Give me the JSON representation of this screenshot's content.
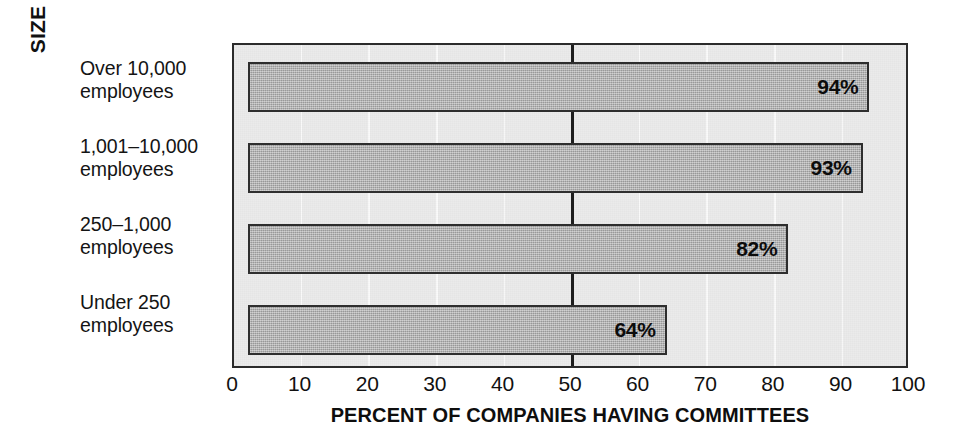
{
  "chart_data": {
    "type": "bar",
    "orientation": "horizontal",
    "title": "",
    "subtitle": "",
    "xlabel": "PERCENT OF COMPANIES HAVING COMMITTEES",
    "ylabel": "SIZE OF COMPANY",
    "categories": [
      "Over 10,000 employees",
      "1,001–10,000 employees",
      "250–1,000 employees",
      "Under 250 employees"
    ],
    "category_lines": [
      [
        "Over 10,000",
        "employees"
      ],
      [
        "1,001–10,000",
        "employees"
      ],
      [
        "250–1,000",
        "employees"
      ],
      [
        "Under 250",
        "employees"
      ]
    ],
    "values": [
      94,
      93,
      82,
      64
    ],
    "value_labels": [
      "94%",
      "93%",
      "82%",
      "64%"
    ],
    "bar_start": 2,
    "xlim": [
      0,
      100
    ],
    "ylim": null,
    "xticks": [
      0,
      10,
      20,
      30,
      40,
      50,
      60,
      70,
      80,
      90,
      100
    ],
    "xtick_labels": [
      "0",
      "10",
      "20",
      "30",
      "40",
      "50",
      "60",
      "70",
      "80",
      "90",
      "100"
    ],
    "grid": true,
    "grid_axis": "x",
    "legend": null,
    "reference_line": {
      "value": 50,
      "label": "",
      "style": "solid-thick-black"
    },
    "colors": {
      "bar_fill": "#a9a9a9",
      "bar_border": "#2e2e2e",
      "plot_background": "#ebebeb",
      "frame": "#2b2b2b",
      "gridline": "#fafafa",
      "reference_line": "#1d1d1d",
      "text": "#111111",
      "page_background": "#ffffff"
    }
  }
}
